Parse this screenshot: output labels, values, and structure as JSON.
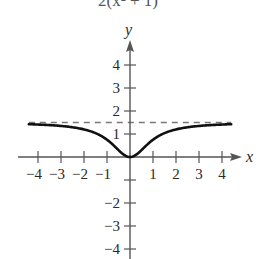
{
  "formula_fragment": "2(x² + 1)",
  "chart_data": {
    "type": "line",
    "title": "",
    "function": "f(x) = 3x² / (2(x² + 1))",
    "xlabel": "x",
    "ylabel": "y",
    "xlim": [
      -4.4,
      4.4
    ],
    "ylim": [
      -4.5,
      4.8
    ],
    "x_ticks": [
      -4,
      -3,
      -2,
      -1,
      1,
      2,
      3,
      4
    ],
    "x_tick_labels": [
      "−4",
      "−3",
      "−2",
      "−1",
      "1",
      "2",
      "3",
      "4"
    ],
    "y_ticks": [
      -4,
      -3,
      -2,
      -1,
      1,
      2,
      3,
      4
    ],
    "y_tick_labels": [
      "−4",
      "−3",
      "−2",
      "",
      "1",
      "2",
      "3",
      "4"
    ],
    "asymptote": {
      "type": "horizontal",
      "y": 1.5,
      "style": "dashed"
    },
    "series": [
      {
        "name": "f(x)",
        "x": [
          -4.4,
          -4,
          -3,
          -2,
          -1.5,
          -1,
          -0.5,
          0,
          0.5,
          1,
          1.5,
          2,
          3,
          4,
          4.4
        ],
        "y": [
          1.42,
          1.41,
          1.35,
          1.2,
          1.04,
          0.75,
          0.3,
          0,
          0.3,
          0.75,
          1.04,
          1.2,
          1.35,
          1.41,
          1.42
        ]
      }
    ],
    "grid": false,
    "legend": null
  },
  "colors": {
    "curve": "#111111",
    "axis": "#555555",
    "asymptote": "#777777",
    "text": "#2a2a2a"
  }
}
